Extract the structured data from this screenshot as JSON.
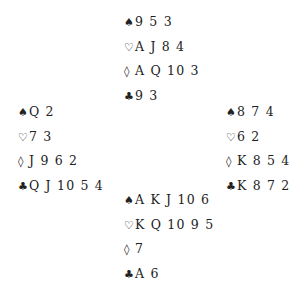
{
  "suit_symbols": {
    "spades": "♠",
    "hearts": "♡",
    "diamonds": "◊",
    "clubs": "♣"
  },
  "hands": {
    "north": {
      "spades": "9 5 3",
      "hearts": "A J 8 4",
      "diamonds": "A Q 10 3",
      "clubs": "9 3"
    },
    "west": {
      "spades": "Q 2",
      "hearts": "7 3",
      "diamonds": "J 9 6 2",
      "clubs": "Q J 10 5 4"
    },
    "east": {
      "spades": "8 7 4",
      "hearts": "6 2",
      "diamonds": "K 8 5 4",
      "clubs": "K 8 7 2"
    },
    "south": {
      "spades": "A K J 10 6",
      "hearts": "K Q 10 9 5",
      "diamonds": "7",
      "clubs": "A 6"
    }
  }
}
